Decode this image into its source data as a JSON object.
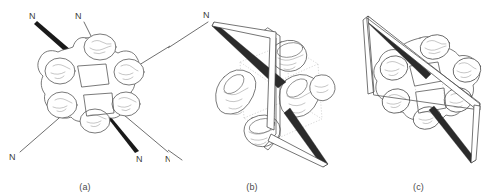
{
  "figure": {
    "kind": "scientific-line-drawing",
    "background_color": "#ffffff",
    "ink_color": "#4d4d4d",
    "bold_vector_color": "#1a1a1a",
    "label_color": "#3d3d3d",
    "atom_symbol": "N",
    "panels": [
      {
        "id": "a",
        "caption": "(a)",
        "view": "face-on",
        "lobe_count": 6,
        "atom_labels": [
          {
            "text": "N",
            "x": 33,
            "y": 16,
            "vector": "bold"
          },
          {
            "text": "N",
            "x": 78,
            "y": 16,
            "vector": "thin"
          },
          {
            "text": "N",
            "x": 12,
            "y": 158,
            "vector": "thin"
          },
          {
            "text": "N",
            "x": 140,
            "y": 160,
            "vector": "bold"
          },
          {
            "text": "N",
            "x": 172,
            "y": 160,
            "vector": "thin"
          }
        ]
      },
      {
        "id": "b",
        "caption": "(b)",
        "view": "edge-on",
        "lobe_count": 6,
        "atom_labels": [
          {
            "text": "N",
            "x": 39,
            "y": 15,
            "vector": "spear"
          }
        ]
      },
      {
        "id": "c",
        "caption": "(c)",
        "view": "tilted",
        "lobe_count": 6,
        "atom_labels": []
      }
    ]
  }
}
